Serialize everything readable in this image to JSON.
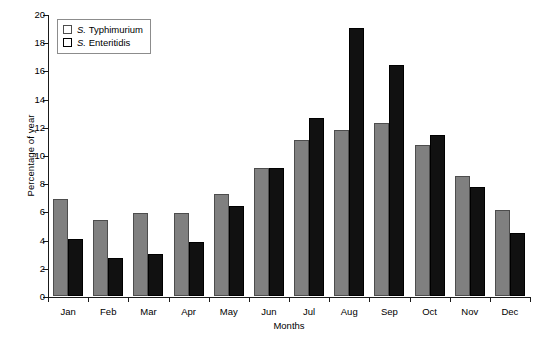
{
  "chart_data": {
    "type": "bar",
    "title": "",
    "xlabel": "Months",
    "ylabel": "Percentage of year",
    "ylim": [
      0,
      20
    ],
    "ytick_labels": [
      "0",
      "2",
      "4",
      "6",
      "8",
      "10",
      "12",
      "14",
      "16",
      "18",
      "20"
    ],
    "yticks": [
      0,
      2,
      4,
      6,
      8,
      10,
      12,
      14,
      16,
      18,
      20
    ],
    "grid": false,
    "legend_position": "top-left",
    "categories": [
      "Jan",
      "Feb",
      "Mar",
      "Apr",
      "May",
      "Jun",
      "Jul",
      "Aug",
      "Sep",
      "Oct",
      "Nov",
      "Dec"
    ],
    "series": [
      {
        "name": "S. Typhimurium",
        "genus": "S.",
        "epithet": "Typhimurium",
        "color": "#808080",
        "values": [
          6.9,
          5.4,
          5.9,
          5.9,
          7.2,
          9.1,
          11.1,
          11.8,
          12.3,
          10.7,
          8.5,
          6.1
        ]
      },
      {
        "name": "S. Enteritidis",
        "genus": "S.",
        "epithet": "Enteritidis",
        "color": "#111111",
        "values": [
          4.05,
          2.7,
          3.0,
          3.8,
          6.4,
          9.1,
          12.6,
          19.0,
          16.4,
          11.4,
          7.7,
          4.5
        ]
      }
    ]
  }
}
